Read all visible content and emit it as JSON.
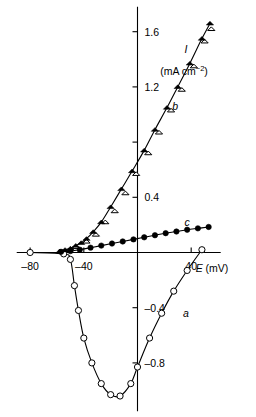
{
  "chart_data": {
    "type": "line",
    "title": "",
    "xlabel": "E (mV)",
    "ylabel": "I (mA cm⁻²)",
    "ylabel_symbol": "I",
    "ylabel_unit": "(mA cm⁻²)",
    "xlim": [
      -90,
      62
    ],
    "ylim": [
      -1.15,
      1.78
    ],
    "grid": false,
    "legend_position": "inline-curve-labels",
    "x_ticks": [
      {
        "value": -80,
        "label": "–80"
      },
      {
        "value": -40,
        "label": "–40"
      },
      {
        "value": 40,
        "label": "40"
      }
    ],
    "y_ticks": [
      {
        "value": 1.6,
        "label": "1.6"
      },
      {
        "value": 1.2,
        "label": "1.2"
      },
      {
        "value": 0.8,
        "label": ""
      },
      {
        "value": 0.4,
        "label": "0.4"
      },
      {
        "value": -0.4,
        "label": "–0.4"
      },
      {
        "value": -0.8,
        "label": "–0.8"
      }
    ],
    "series": [
      {
        "name": "a",
        "label": "a",
        "marker": "open-circle",
        "label_x": 36,
        "label_y": -0.47,
        "points": [
          {
            "x": -80,
            "y": 0.0
          },
          {
            "x": -55,
            "y": -0.01
          },
          {
            "x": -50,
            "y": -0.05
          },
          {
            "x": -47,
            "y": -0.24
          },
          {
            "x": -44,
            "y": -0.42
          },
          {
            "x": -40,
            "y": -0.62
          },
          {
            "x": -34,
            "y": -0.8
          },
          {
            "x": -27,
            "y": -0.95
          },
          {
            "x": -20,
            "y": -1.03
          },
          {
            "x": -13,
            "y": -1.04
          },
          {
            "x": -5,
            "y": -0.95
          },
          {
            "x": 0,
            "y": -0.83
          },
          {
            "x": 9,
            "y": -0.62
          },
          {
            "x": 18,
            "y": -0.44
          },
          {
            "x": 27,
            "y": -0.28
          },
          {
            "x": 37,
            "y": -0.13
          },
          {
            "x": 48,
            "y": 0.02
          }
        ]
      },
      {
        "name": "b",
        "label": "b",
        "marker": "filled-triangle-with-open-triangle",
        "label_x": 28,
        "label_y": 1.03,
        "points_filled": [
          {
            "x": -58,
            "y": 0.01
          },
          {
            "x": -54,
            "y": 0.02
          },
          {
            "x": -50,
            "y": 0.03
          },
          {
            "x": -46,
            "y": 0.05
          },
          {
            "x": -42,
            "y": 0.07
          },
          {
            "x": -38,
            "y": 0.1
          },
          {
            "x": -33,
            "y": 0.15
          },
          {
            "x": -27,
            "y": 0.22
          },
          {
            "x": -20,
            "y": 0.33
          },
          {
            "x": -12,
            "y": 0.46
          },
          {
            "x": -4,
            "y": 0.59
          },
          {
            "x": 5,
            "y": 0.74
          },
          {
            "x": 13,
            "y": 0.89
          },
          {
            "x": 22,
            "y": 1.05
          },
          {
            "x": 30,
            "y": 1.2
          },
          {
            "x": 39,
            "y": 1.37
          },
          {
            "x": 48,
            "y": 1.55
          },
          {
            "x": 54,
            "y": 1.66
          }
        ],
        "points_open": [
          {
            "x": -46,
            "y": 0.04
          },
          {
            "x": -38,
            "y": 0.08
          },
          {
            "x": -31,
            "y": 0.13
          },
          {
            "x": -24,
            "y": 0.22
          },
          {
            "x": -17,
            "y": 0.3
          },
          {
            "x": -9,
            "y": 0.43
          },
          {
            "x": -1,
            "y": 0.57
          },
          {
            "x": 8,
            "y": 0.72
          },
          {
            "x": 16,
            "y": 0.87
          },
          {
            "x": 25,
            "y": 1.03
          },
          {
            "x": 33,
            "y": 1.18
          },
          {
            "x": 42,
            "y": 1.35
          },
          {
            "x": 50,
            "y": 1.53
          },
          {
            "x": 55,
            "y": 1.62
          }
        ]
      },
      {
        "name": "c",
        "label": "c",
        "marker": "filled-circle",
        "label_x": 37,
        "label_y": 0.19,
        "points": [
          {
            "x": -57,
            "y": 0.005
          },
          {
            "x": -50,
            "y": 0.01
          },
          {
            "x": -43,
            "y": 0.02
          },
          {
            "x": -35,
            "y": 0.035
          },
          {
            "x": -27,
            "y": 0.05
          },
          {
            "x": -19,
            "y": 0.065
          },
          {
            "x": -11,
            "y": 0.08
          },
          {
            "x": -3,
            "y": 0.095
          },
          {
            "x": 5,
            "y": 0.11
          },
          {
            "x": 13,
            "y": 0.125
          },
          {
            "x": 21,
            "y": 0.14
          },
          {
            "x": 29,
            "y": 0.152
          },
          {
            "x": 37,
            "y": 0.165
          },
          {
            "x": 45,
            "y": 0.175
          },
          {
            "x": 53,
            "y": 0.185
          }
        ]
      }
    ]
  }
}
